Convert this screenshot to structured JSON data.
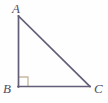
{
  "figure": {
    "name": "right-triangle-ABC",
    "background_color": "#fefefe",
    "stroke_color": "#635d78",
    "label_color": "#514b63",
    "right_angle_color": "#c7b9a3",
    "stroke_width": 1.6,
    "labels": {
      "a": "A",
      "b": "B",
      "c": "C"
    },
    "vertices": {
      "a": {
        "x": 18,
        "y": 16
      },
      "b": {
        "x": 18,
        "y": 87
      },
      "c": {
        "x": 90,
        "y": 87
      }
    },
    "right_angle_marker": {
      "at_vertex": "B",
      "size": 10,
      "x": 18,
      "y": 77
    },
    "sides": [
      {
        "name": "AB",
        "from": "A",
        "to": "B"
      },
      {
        "name": "BC",
        "from": "B",
        "to": "C"
      },
      {
        "name": "CA",
        "from": "C",
        "to": "A"
      }
    ]
  }
}
